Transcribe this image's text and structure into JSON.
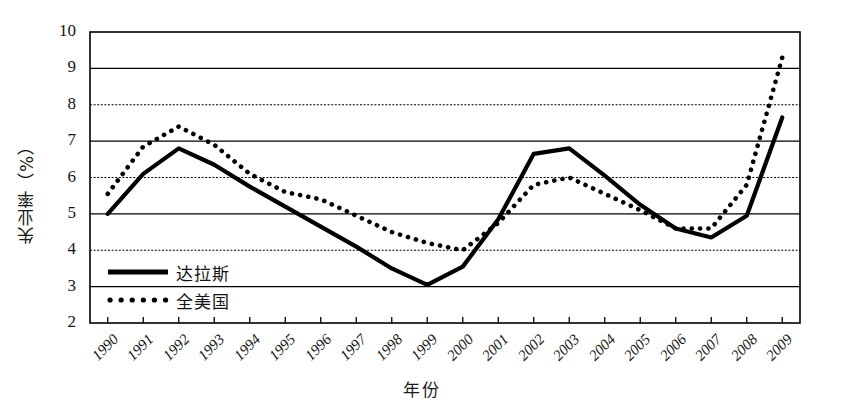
{
  "chart_data": {
    "type": "line",
    "title": "",
    "xlabel": "年份",
    "ylabel": "失业率（%）",
    "ylim": [
      2,
      10
    ],
    "yticks": [
      2,
      3,
      4,
      5,
      6,
      7,
      8,
      9,
      10
    ],
    "grid": true,
    "legend_position": "inside-left-lower",
    "categories": [
      "1990",
      "1991",
      "1992",
      "1993",
      "1994",
      "1995",
      "1996",
      "1997",
      "1998",
      "1999",
      "2000",
      "2001",
      "2002",
      "2003",
      "2004",
      "2005",
      "2006",
      "2007",
      "2008",
      "2009"
    ],
    "series": [
      {
        "name": "达拉斯",
        "style": "solid",
        "color": "#000000",
        "values": [
          5.0,
          6.1,
          6.8,
          6.35,
          5.75,
          5.2,
          4.65,
          4.1,
          3.5,
          3.05,
          3.55,
          4.85,
          6.65,
          6.8,
          6.05,
          5.25,
          4.6,
          4.35,
          4.95,
          7.65
        ]
      },
      {
        "name": "全美国",
        "style": "dotted",
        "color": "#000000",
        "values": [
          5.55,
          6.85,
          7.4,
          6.9,
          6.1,
          5.6,
          5.4,
          4.95,
          4.5,
          4.2,
          4.0,
          4.75,
          5.8,
          6.0,
          5.55,
          5.1,
          4.6,
          4.6,
          5.8,
          9.3
        ]
      }
    ]
  },
  "legend": {
    "items": [
      {
        "label": "达拉斯",
        "style": "solid"
      },
      {
        "label": "全美国",
        "style": "dotted"
      }
    ]
  },
  "axes": {
    "y_label": "失业率（%）",
    "x_label": "年份"
  }
}
